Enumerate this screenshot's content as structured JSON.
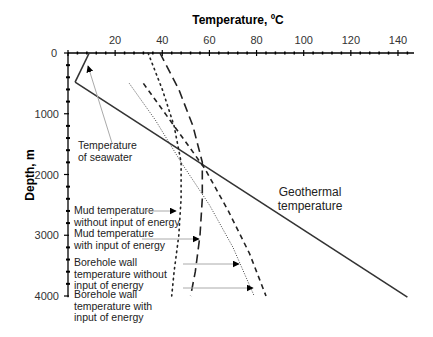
{
  "chart_data": {
    "type": "line",
    "title": "",
    "xlabel": "Temperature, ºC",
    "ylabel": "Depth, m",
    "xlim": [
      0,
      146
    ],
    "ylim": [
      4000,
      0
    ],
    "x_axis_position": "top",
    "y_inverted": true,
    "grid": false,
    "x_ticks": [
      20,
      40,
      60,
      80,
      100,
      120,
      140
    ],
    "x_tick_zero_label": "0",
    "y_ticks": [
      0,
      1000,
      2000,
      3000,
      4000
    ],
    "series": [
      {
        "name": "Temperature of seawater",
        "style": "solid",
        "points": [
          [
            9,
            0
          ],
          [
            3,
            480
          ]
        ]
      },
      {
        "name": "Geothermal temperature",
        "style": "solid",
        "points": [
          [
            3,
            480
          ],
          [
            144,
            4020
          ]
        ]
      },
      {
        "name": "Mud temperature without input of energy",
        "style": "dotted",
        "points": [
          [
            34,
            0
          ],
          [
            40,
            600
          ],
          [
            45,
            1200
          ],
          [
            48,
            1800
          ],
          [
            48,
            2400
          ],
          [
            47,
            3000
          ],
          [
            45,
            3600
          ],
          [
            44,
            4000
          ]
        ]
      },
      {
        "name": "Mud temperature with input of energy",
        "style": "longdash",
        "points": [
          [
            39,
            0
          ],
          [
            47,
            600
          ],
          [
            53,
            1200
          ],
          [
            57,
            1800
          ],
          [
            57,
            2400
          ],
          [
            56,
            3000
          ],
          [
            54,
            3600
          ],
          [
            52,
            4000
          ]
        ]
      },
      {
        "name": "Borehole wall temperature without input of energy",
        "style": "finedot",
        "points": [
          [
            26,
            500
          ],
          [
            37,
            1100
          ],
          [
            48,
            1800
          ],
          [
            60,
            2500
          ],
          [
            70,
            3200
          ],
          [
            79,
            4000
          ]
        ]
      },
      {
        "name": "Borehole wall temperature with input of energy",
        "style": "dashed",
        "points": [
          [
            32,
            500
          ],
          [
            45,
            1200
          ],
          [
            58,
            1900
          ],
          [
            68,
            2600
          ],
          [
            77,
            3300
          ],
          [
            84,
            4000
          ]
        ]
      }
    ],
    "annotations": [
      {
        "text": [
          "Temperature",
          "of seawater"
        ],
        "arrow_to": [
          8,
          200
        ]
      },
      {
        "text": [
          "Geothermal",
          "temperature"
        ]
      },
      {
        "text": [
          "Mud temperature",
          "without input of energy"
        ],
        "arrow_to": [
          47,
          2680
        ]
      },
      {
        "text": [
          "Mud temperature",
          "with input of energy"
        ],
        "arrow_to": [
          56,
          3060
        ]
      },
      {
        "text": [
          "Borehole wall",
          "temperature without",
          "input of energy"
        ],
        "arrow_to": [
          74,
          3500
        ]
      },
      {
        "text": [
          "Borehole wall",
          "temperature with",
          "input of energy"
        ],
        "arrow_to": [
          80,
          3950
        ]
      }
    ]
  }
}
